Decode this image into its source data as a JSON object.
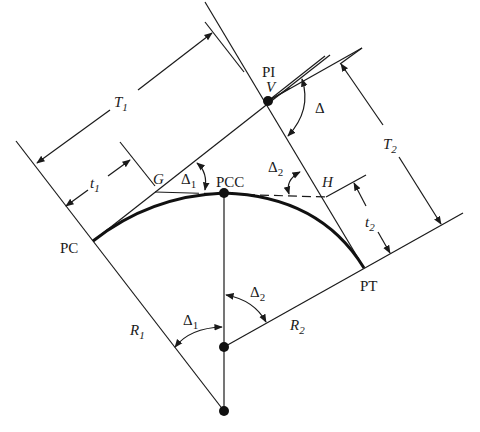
{
  "diagram": {
    "type": "compound horizontal curve geometry",
    "labels": {
      "pi": "PI",
      "v": "V",
      "pc": "PC",
      "pcc": "PCC",
      "pt": "PT",
      "g": "G",
      "h": "H",
      "delta": "Δ",
      "delta1": "Δ",
      "delta1_sub": "1",
      "delta2": "Δ",
      "delta2_sub": "2",
      "t1": "T",
      "t1_sub": "1",
      "t2": "T",
      "t2_sub": "2",
      "tt1": "t",
      "tt1_sub": "1",
      "tt2": "t",
      "tt2_sub": "2",
      "r1": "R",
      "r1_sub": "1",
      "r2": "R",
      "r2_sub": "2",
      "delta1_lower": "Δ",
      "delta1_lower_sub": "1",
      "delta2_lower": "Δ",
      "delta2_lower_sub": "2"
    },
    "points": {
      "PI": [
        268,
        101
      ],
      "PC": [
        93,
        241
      ],
      "PCC": [
        224,
        193
      ],
      "PT": [
        364,
        268
      ],
      "G": [
        155,
        192
      ],
      "H": [
        326,
        197
      ],
      "O2": [
        224,
        347
      ],
      "O1": [
        224,
        411
      ]
    }
  }
}
